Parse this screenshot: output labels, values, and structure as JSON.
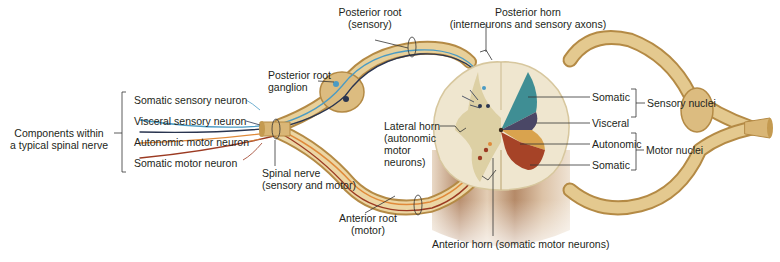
{
  "title": "Components within a typical spinal nerve",
  "colors": {
    "nerve": "#d8b779",
    "nerve_dark": "#b68f4c",
    "nerve_light": "#eedcae",
    "somatic_sensory": "#4a9bc4",
    "visceral_sensory": "#2a3550",
    "autonomic_motor": "#e08a3a",
    "somatic_motor": "#9b3a22",
    "gray_somatic_sensory": "#3f8e94",
    "gray_visceral_sensory": "#4a4766",
    "gray_autonomic": "#d9a34e",
    "gray_somatic_motor": "#a64327",
    "white_matter": "#efe6cf",
    "gray_matter": "#d9cb9c",
    "cord_stem": "#c9a88a"
  },
  "labels": {
    "components": [
      "Components within",
      "a typical spinal nerve"
    ],
    "somatic_sensory_neuron": "Somatic sensory neuron",
    "visceral_sensory_neuron": "Visceral sensory neuron",
    "autonomic_motor_neuron": "Autonomic motor neuron",
    "somatic_motor_neuron": "Somatic motor neuron",
    "posterior_root_ganglion": [
      "Posterior root",
      "ganglion"
    ],
    "posterior_root": [
      "Posterior root",
      "(sensory)"
    ],
    "posterior_horn": [
      "Posterior horn",
      "(interneurons and sensory axons)"
    ],
    "spinal_nerve": [
      "Spinal nerve",
      "(sensory and motor)"
    ],
    "lateral_horn": [
      "Lateral horn",
      "(autonomic",
      "motor",
      "neurons)"
    ],
    "anterior_root": [
      "Anterior root",
      "(motor)"
    ],
    "anterior_horn": "Anterior horn (somatic motor neurons)",
    "somatic_top": "Somatic",
    "visceral": "Visceral",
    "autonomic": "Autonomic",
    "somatic_bottom": "Somatic",
    "sensory_nuclei": "Sensory nuclei",
    "motor_nuclei": "Motor nuclei"
  }
}
